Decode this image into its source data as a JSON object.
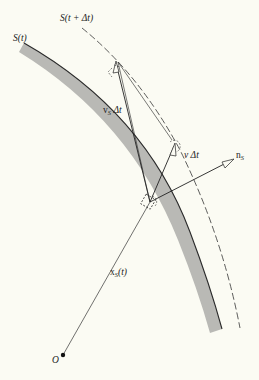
{
  "diagram": {
    "type": "moving-surface-kinematics",
    "colors": {
      "background": "#fbfbf3",
      "surface_band": "#b8b8b4",
      "surface_edge": "#2a2a2a",
      "line": "#222222"
    },
    "labels": {
      "surface_t": "S(t)",
      "surface_t_dt": "S(t + Δt)",
      "vs_dt_main": "v",
      "vs_dt_sub": "S",
      "vs_dt_tail": " Δt",
      "v_dt": "v Δt",
      "ns_main": "n",
      "ns_sub": "S",
      "xs_main": "x",
      "xs_sub": "S",
      "xs_tail": "(t)",
      "origin": "O"
    },
    "elements": [
      {
        "name": "surface-S-t",
        "style": "gray band with dark edge"
      },
      {
        "name": "surface-S-t-plus-dt",
        "style": "dashed curve"
      },
      {
        "name": "position-vector-xS",
        "from": "O",
        "to": "surface point"
      },
      {
        "name": "vector-vS-dt",
        "from": "surface point",
        "to": "S(t+Δt)"
      },
      {
        "name": "vector-v-dt",
        "from": "surface point",
        "direction": "up-right"
      },
      {
        "name": "normal-nS",
        "from": "surface point",
        "direction": "outward normal"
      }
    ]
  }
}
